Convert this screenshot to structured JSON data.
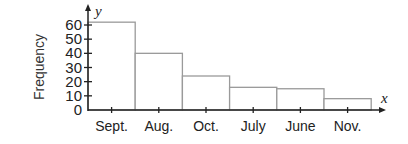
{
  "chart_data": {
    "type": "bar",
    "title": "",
    "xlabel": "x",
    "ylabel": "Frequency",
    "y_axis_var": "y",
    "categories": [
      "Sept.",
      "Aug.",
      "Oct.",
      "July",
      "June",
      "Nov."
    ],
    "values": [
      62,
      40,
      24,
      16,
      15,
      8
    ],
    "ylim": [
      0,
      60
    ],
    "yticks": [
      0,
      10,
      20,
      30,
      40,
      50,
      60
    ],
    "grid": false,
    "legend": null,
    "bar_style": "histogram (adjacent bars, no fill)"
  },
  "colors": {
    "bar_stroke": "#9a9a9a",
    "axis": "#222222",
    "text": "#222222"
  }
}
